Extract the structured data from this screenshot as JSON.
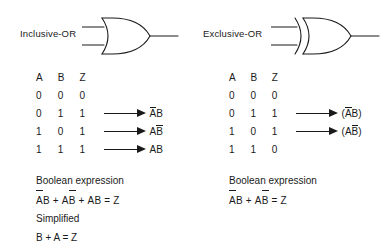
{
  "diagram": {
    "title_left": "Inclusive-OR",
    "title_right": "Exclusive-OR",
    "line_color": "#1a1a1a",
    "background": "#ffffff"
  },
  "panels": [
    {
      "id": "inclusive",
      "gate_label": "Inclusive-OR",
      "gate_symbol": "or-gate",
      "table": {
        "headers": [
          "A",
          "B",
          "Z"
        ],
        "rows": [
          {
            "a": "0",
            "b": "0",
            "z": "0",
            "arrow": false,
            "term_pre": "",
            "term": [],
            "term_post": ""
          },
          {
            "a": "0",
            "b": "1",
            "z": "1",
            "arrow": true,
            "term_pre": "",
            "term": [
              {
                "t": "A",
                "bar": true
              },
              {
                "t": "B",
                "bar": false
              }
            ],
            "term_post": ""
          },
          {
            "a": "1",
            "b": "0",
            "z": "1",
            "arrow": true,
            "term_pre": "",
            "term": [
              {
                "t": "A",
                "bar": false
              },
              {
                "t": "B",
                "bar": true
              }
            ],
            "term_post": ""
          },
          {
            "a": "1",
            "b": "1",
            "z": "1",
            "arrow": true,
            "term_pre": "",
            "term": [
              {
                "t": "A",
                "bar": false
              },
              {
                "t": "B",
                "bar": false
              }
            ],
            "term_post": ""
          }
        ]
      },
      "expression_heading": "Boolean expression",
      "expression": "ĀB + AB̄ + AB = Z",
      "simplified_heading": "Simplified",
      "simplified": "B + A = Z"
    },
    {
      "id": "exclusive",
      "gate_label": "Exclusive-OR",
      "gate_symbol": "xor-gate",
      "table": {
        "headers": [
          "A",
          "B",
          "Z"
        ],
        "rows": [
          {
            "a": "0",
            "b": "0",
            "z": "0",
            "arrow": false,
            "term_pre": "",
            "term": [],
            "term_post": ""
          },
          {
            "a": "0",
            "b": "1",
            "z": "1",
            "arrow": true,
            "term_pre": "(",
            "term": [
              {
                "t": "A",
                "bar": true
              },
              {
                "t": "B",
                "bar": false
              }
            ],
            "term_post": ")"
          },
          {
            "a": "1",
            "b": "0",
            "z": "1",
            "arrow": true,
            "term_pre": "(",
            "term": [
              {
                "t": "A",
                "bar": false
              },
              {
                "t": "B",
                "bar": true
              }
            ],
            "term_post": ")"
          },
          {
            "a": "1",
            "b": "1",
            "z": "0",
            "arrow": false,
            "term_pre": "",
            "term": [],
            "term_post": ""
          }
        ]
      },
      "expression_heading": "Boolean expression",
      "expression": "ĀB + AB̄ = Z",
      "simplified_heading": "",
      "simplified": ""
    }
  ],
  "labels": {
    "header_a": "A",
    "header_b": "B",
    "header_z": "Z",
    "boolean_expression": "Boolean expression",
    "simplified": "Simplified",
    "plus": "+",
    "equals": "=",
    "z_out": "Z",
    "a_out": "A",
    "b_out": "B",
    "paren_open": "(",
    "paren_close": ")",
    "left_simplified_expr": "B + A = Z"
  }
}
